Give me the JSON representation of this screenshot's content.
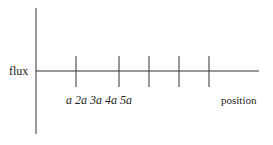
{
  "diagram": {
    "y_axis_label": "flux",
    "x_axis_label": "position",
    "tick_labels": [
      "a",
      "2a",
      "3a",
      "4a",
      "5a"
    ],
    "tick_labels_text": "a 2a 3a 4a 5a",
    "tick_count": 5,
    "colors": {
      "line": "#333333",
      "text": "#222222",
      "background": "#ffffff"
    }
  }
}
